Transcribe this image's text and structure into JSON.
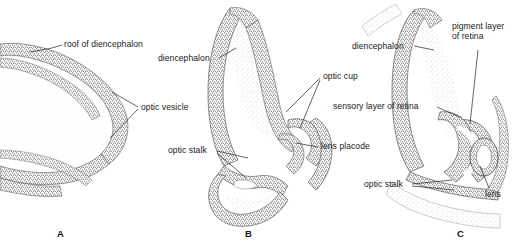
{
  "figure": {
    "background_color": "#ffffff",
    "ink_color": "#3a3a3a",
    "stipple_dark": "#6e6e6e",
    "stipple_light": "#c9c9c9"
  },
  "panels": [
    {
      "letter": "A",
      "name": "optic-vesicle-stage",
      "labels": [
        {
          "id": "roof-of-diencephalon",
          "text": "roof of diencephalon"
        },
        {
          "id": "optic-vesicle",
          "text": "optic vesicle"
        }
      ]
    },
    {
      "letter": "B",
      "name": "optic-cup-lens-placode-stage",
      "labels": [
        {
          "id": "diencephalon",
          "text": "diencephalon"
        },
        {
          "id": "optic-cup",
          "text": "optic cup"
        },
        {
          "id": "optic-stalk",
          "text": "optic stalk"
        },
        {
          "id": "lens-placode",
          "text": "lens placode"
        }
      ]
    },
    {
      "letter": "C",
      "name": "optic-cup-lens-vesicle-stage",
      "labels": [
        {
          "id": "diencephalon",
          "text": "diencephalon"
        },
        {
          "id": "pigment-layer-of-retina",
          "line1": "pigment layer",
          "line2": "of retina"
        },
        {
          "id": "sensory-layer-of-retina",
          "text": "sensory layer of retina"
        },
        {
          "id": "optic-stalk",
          "text": "optic stalk"
        },
        {
          "id": "lens",
          "text": "lens"
        }
      ]
    }
  ]
}
